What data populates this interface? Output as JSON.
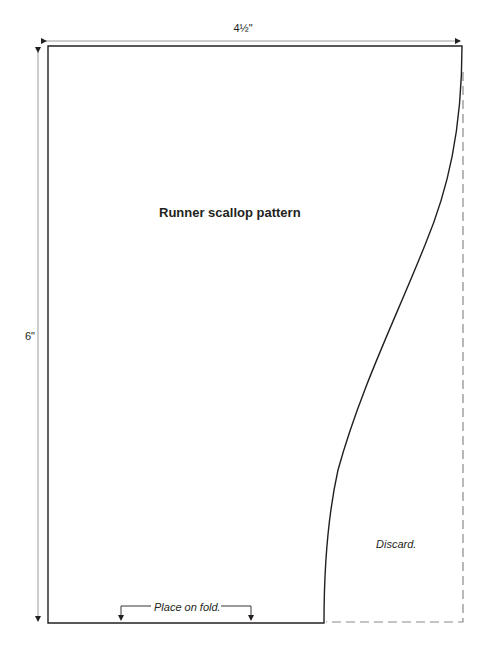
{
  "diagram": {
    "title": "Runner scallop pattern",
    "dimensions": {
      "width_label": "4½\"",
      "height_label": "6\""
    },
    "annotations": {
      "fold_label": "Place on fold.",
      "discard_label": "Discard."
    },
    "colors": {
      "outline": "#231f20",
      "dimension_line": "#9a9a9a",
      "dashed_line": "#8a8a8a"
    },
    "shapes": [
      {
        "type": "outline",
        "description": "Pattern piece with straight left, top and bottom edges and a curved scallop right edge"
      },
      {
        "type": "dashed",
        "description": "Discarded area boundary on right side"
      },
      {
        "type": "dimension-arrow",
        "orientation": "horizontal",
        "label": "4½\""
      },
      {
        "type": "dimension-arrow",
        "orientation": "vertical",
        "label": "6\""
      },
      {
        "type": "fold-bracket",
        "label": "Place on fold."
      }
    ]
  }
}
